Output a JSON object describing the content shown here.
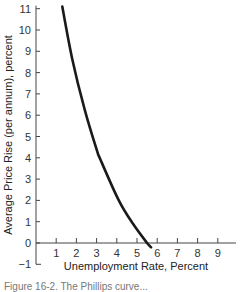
{
  "chart_data": {
    "type": "line",
    "title": "",
    "xlabel": "Unemployment Rate, Percent",
    "ylabel": "Average Price Rise (per annum), percent",
    "xlim": [
      0,
      9.9
    ],
    "ylim": [
      -1,
      11
    ],
    "x_ticks": [
      1,
      2,
      3,
      4,
      5,
      6,
      7,
      8,
      9
    ],
    "y_ticks": [
      -1,
      0,
      1,
      2,
      3,
      4,
      5,
      6,
      7,
      8,
      9,
      10,
      11
    ],
    "grid": false,
    "legend": null,
    "series": [
      {
        "name": "Phillips curve",
        "x": [
          1.3,
          1.8,
          2.4,
          3.0,
          3.2,
          4.1,
          4.8,
          5.5,
          5.7
        ],
        "y": [
          11.1,
          8.6,
          6.3,
          4.4,
          3.9,
          2.0,
          0.9,
          0.0,
          -0.2
        ],
        "color": "#1a1a1a"
      }
    ]
  },
  "caption": "Figure 16-2. The Phillips curve..."
}
